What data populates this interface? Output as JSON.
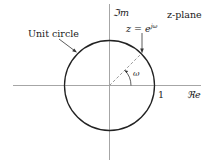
{
  "diagram": {
    "title": "z-plane",
    "imag_axis_label": "ℑm",
    "real_axis_label": "ℜe",
    "unit_circle_label": "Unit circle",
    "point_label": "z = e",
    "point_label_exponent": "jω",
    "angle_label": "ω",
    "real_tick_label": "1",
    "colors": {
      "axis": "#a6a6a6",
      "circle": "#222222",
      "text": "#222222"
    }
  }
}
